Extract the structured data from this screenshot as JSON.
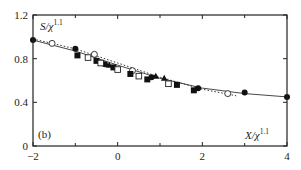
{
  "chart_data": {
    "type": "scatter",
    "title": "",
    "panel_label": "(b)",
    "xlabel": "X/χ",
    "xlabel_exp": "1.1",
    "ylabel": "S/χ",
    "ylabel_exp": "1.1",
    "xlim": [
      -2,
      4
    ],
    "ylim": [
      0,
      1.2
    ],
    "x_ticks": [
      -2,
      0,
      2,
      4
    ],
    "x_minor_ticks": [
      -1,
      1,
      3
    ],
    "y_ticks": [
      0,
      0.4,
      0.8,
      1.2
    ],
    "x_tick_labels": [
      "−2",
      "0",
      "2",
      "4"
    ],
    "y_tick_labels": [
      "0",
      "0.4",
      "0.8",
      "1.2"
    ],
    "grid": false,
    "series": [
      {
        "name": "filled circles",
        "marker": "filled-circle",
        "x": [
          -2.0,
          -1.0,
          -0.3,
          0.8,
          1.9,
          3.0,
          4.0
        ],
        "y": [
          0.97,
          0.89,
          0.75,
          0.63,
          0.53,
          0.49,
          0.45
        ]
      },
      {
        "name": "open circles",
        "marker": "open-circle",
        "x": [
          -1.55,
          -0.55,
          0.35,
          2.6
        ],
        "y": [
          0.94,
          0.84,
          0.69,
          0.48
        ]
      },
      {
        "name": "filled squares",
        "marker": "filled-square",
        "x": [
          -0.95,
          -0.5,
          -0.1,
          0.3,
          0.7,
          1.4,
          1.8
        ],
        "y": [
          0.83,
          0.78,
          0.72,
          0.66,
          0.61,
          0.56,
          0.51
        ]
      },
      {
        "name": "open squares",
        "marker": "open-square",
        "x": [
          -0.7,
          -0.4,
          0.0,
          0.5,
          1.2
        ],
        "y": [
          0.81,
          0.76,
          0.7,
          0.64,
          0.57
        ]
      },
      {
        "name": "filled triangles",
        "marker": "filled-triangle",
        "x": [
          -0.2,
          0.9,
          1.1
        ],
        "y": [
          0.74,
          0.64,
          0.62
        ]
      }
    ],
    "curves": [
      {
        "name": "solid fit",
        "style": "solid",
        "x": [
          -2,
          -1,
          0,
          1,
          2,
          3,
          4
        ],
        "y": [
          0.97,
          0.87,
          0.74,
          0.62,
          0.53,
          0.48,
          0.45
        ]
      },
      {
        "name": "dotted fit",
        "style": "dotted",
        "x": [
          -2,
          -1,
          0,
          1,
          2,
          2.8
        ],
        "y": [
          0.98,
          0.89,
          0.76,
          0.63,
          0.52,
          0.46
        ]
      }
    ]
  }
}
